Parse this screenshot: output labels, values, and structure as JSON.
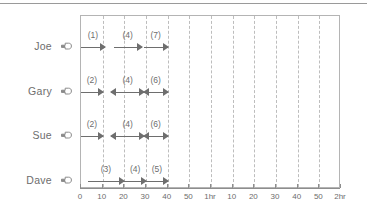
{
  "figure": {
    "top_rule": true,
    "pointer_icon": "pointing-hand-icon"
  },
  "chart_data": {
    "type": "timeline",
    "title": "",
    "xlabel": "",
    "ylabel": "",
    "xlim": [
      0,
      120
    ],
    "grid": true,
    "grid_step_minutes": 10,
    "axis_unit": "minutes",
    "legend_position": "none",
    "x_ticks": [
      {
        "value": 0,
        "label": "0"
      },
      {
        "value": 10,
        "label": "10"
      },
      {
        "value": 20,
        "label": "20"
      },
      {
        "value": 30,
        "label": "30"
      },
      {
        "value": 40,
        "label": "40"
      },
      {
        "value": 50,
        "label": "50"
      },
      {
        "value": 60,
        "label": "1hr"
      },
      {
        "value": 70,
        "label": "10"
      },
      {
        "value": 80,
        "label": "20"
      },
      {
        "value": 90,
        "label": "30"
      },
      {
        "value": 100,
        "label": "40"
      },
      {
        "value": 110,
        "label": "50"
      },
      {
        "value": 120,
        "label": "2hr"
      }
    ],
    "rows": [
      {
        "name": "Joe",
        "spans": [
          {
            "label": "(1)",
            "start": 0,
            "end": 11,
            "arrow": "right"
          },
          {
            "label": "(4)",
            "start": 15,
            "end": 28,
            "arrow": "right"
          },
          {
            "label": "(7)",
            "start": 29,
            "end": 40,
            "arrow": "right"
          }
        ]
      },
      {
        "name": "Gary",
        "spans": [
          {
            "label": "(2)",
            "start": 0,
            "end": 10,
            "arrow": "right"
          },
          {
            "label": "(4)",
            "start": 14,
            "end": 29,
            "arrow": "both"
          },
          {
            "label": "(6)",
            "start": 29,
            "end": 40,
            "arrow": "both"
          }
        ]
      },
      {
        "name": "Sue",
        "spans": [
          {
            "label": "(2)",
            "start": 0,
            "end": 10,
            "arrow": "right"
          },
          {
            "label": "(4)",
            "start": 14,
            "end": 29,
            "arrow": "both"
          },
          {
            "label": "(6)",
            "start": 29,
            "end": 40,
            "arrow": "both"
          }
        ]
      },
      {
        "name": "Dave",
        "spans": [
          {
            "label": "(3)",
            "start": 3,
            "end": 20,
            "arrow": "right"
          },
          {
            "label": "(4)",
            "start": 20,
            "end": 30,
            "arrow": "right"
          },
          {
            "label": "(5)",
            "start": 30,
            "end": 40,
            "arrow": "right"
          }
        ]
      }
    ]
  }
}
